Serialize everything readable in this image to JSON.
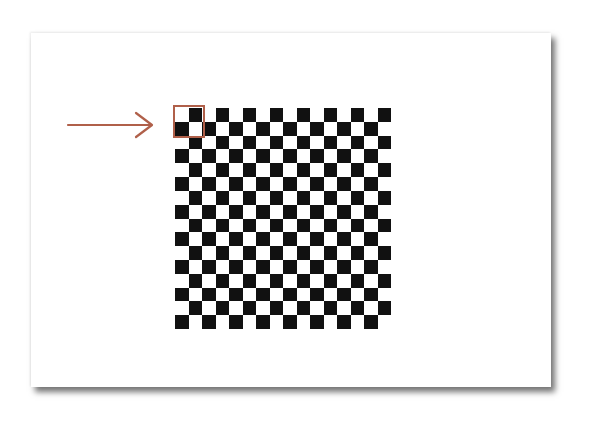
{
  "figure": {
    "grid": {
      "rows": 16,
      "cols": 16,
      "first_cell_color": "white",
      "colors": {
        "black": "#111111",
        "white": "#ffffff"
      }
    },
    "highlight": {
      "row_start": 0,
      "col_start": 0,
      "rows": 2,
      "cols": 2,
      "color": "#b0604a"
    },
    "arrow": {
      "direction": "right",
      "color": "#b0604a"
    },
    "card": {
      "background": "#ffffff",
      "shadow": true
    }
  }
}
